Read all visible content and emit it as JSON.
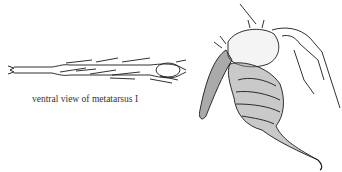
{
  "figure": {
    "panels": [
      {
        "id": "metatarsus",
        "description": "line drawing of leg segment with setae",
        "caption": "ventral view of metatarsus I"
      },
      {
        "id": "palpal-organ",
        "description": "stippled drawing of bulb with tapering embolus, hairy tarsus and segments"
      }
    ],
    "colors": {
      "ink": "#1a1a1a",
      "background": "#ffffff"
    }
  }
}
